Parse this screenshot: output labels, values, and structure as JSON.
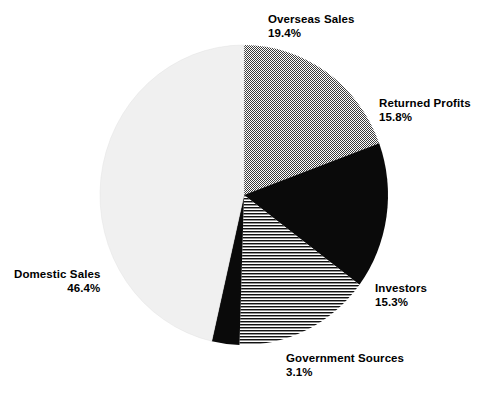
{
  "chart_data": {
    "type": "pie",
    "title": "",
    "subtitle": "",
    "xlabel": "",
    "ylabel": "",
    "legend_position": "none",
    "grid": false,
    "start_angle_deg": 0,
    "direction": "clockwise",
    "categories": [
      "Overseas Sales",
      "Returned Profits",
      "Investors",
      "Government Sources",
      "Domestic Sales"
    ],
    "values": [
      19.4,
      15.8,
      15.3,
      3.1,
      46.4
    ],
    "value_unit": "percent",
    "total": 100.0,
    "slices": [
      {
        "label": "Overseas Sales",
        "value": 19.4,
        "value_text": "19.4%",
        "fill_style": "dither-50",
        "color": "#808080",
        "start_deg": 0.0,
        "end_deg": 69.84
      },
      {
        "label": "Returned Profits",
        "value": 15.8,
        "value_text": "15.8%",
        "fill_style": "solid",
        "color": "#0a0a0a",
        "start_deg": 69.84,
        "end_deg": 126.72
      },
      {
        "label": "Investors",
        "value": 15.3,
        "value_text": "15.3%",
        "fill_style": "horizontal-lines",
        "color": "#111111",
        "start_deg": 126.72,
        "end_deg": 181.8
      },
      {
        "label": "Government Sources",
        "value": 3.1,
        "value_text": "3.1%",
        "fill_style": "solid",
        "color": "#0a0a0a",
        "start_deg": 181.8,
        "end_deg": 192.96
      },
      {
        "label": "Domestic Sales",
        "value": 46.4,
        "value_text": "46.4%",
        "fill_style": "solid",
        "color": "#f0f0f0",
        "start_deg": 192.96,
        "end_deg": 360.0
      }
    ]
  },
  "labels": {
    "overseas": {
      "name": "Overseas Sales",
      "pct": "19.4%"
    },
    "returned": {
      "name": "Returned Profits",
      "pct": "15.8%"
    },
    "investors": {
      "name": "Investors",
      "pct": "15.3%"
    },
    "government": {
      "name": "Government Sources",
      "pct": "3.1%"
    },
    "domestic": {
      "name": "Domestic Sales",
      "pct": "46.4%"
    }
  },
  "style": {
    "background": "#ffffff",
    "text_color": "#000000",
    "gray_mid": "#808080",
    "gray_light": "#f0f0f0",
    "black": "#0a0a0a"
  }
}
